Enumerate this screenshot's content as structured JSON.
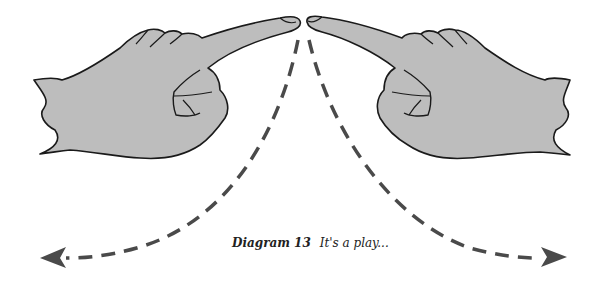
{
  "diagram": {
    "caption_label": "Diagram 13",
    "caption_text": "It's a play...",
    "elements": [
      {
        "name": "left-pointing-hand",
        "description": "Left hand with index finger pointing right toward center"
      },
      {
        "name": "right-pointing-hand",
        "description": "Right hand with index finger pointing left toward center"
      },
      {
        "name": "left-dashed-arrow",
        "description": "Dashed curved arrow from left fingertip sweeping down to bottom-left"
      },
      {
        "name": "right-dashed-arrow",
        "description": "Dashed curved arrow from right fingertip sweeping down to bottom-right"
      }
    ],
    "colors": {
      "hand_fill": "#bdbdbd",
      "outline": "#1a1a1a",
      "arrow": "#4a4a4a",
      "background": "#ffffff"
    }
  }
}
